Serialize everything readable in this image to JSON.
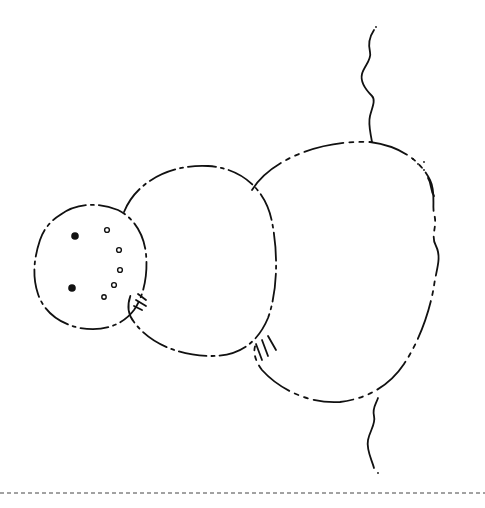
{
  "image": {
    "subject": "snowman line drawing (rotated 90 degrees)",
    "style": "black ink outline on white, coloring page",
    "ink_color": "#111111",
    "background_color": "#ffffff"
  },
  "elements": {
    "head": {
      "eyes": 2,
      "mouth_dots": 5
    },
    "middle_body": {},
    "bottom_body": {},
    "snow_ground": {},
    "cut_line": {
      "style": "dashed",
      "position": "bottom"
    }
  }
}
